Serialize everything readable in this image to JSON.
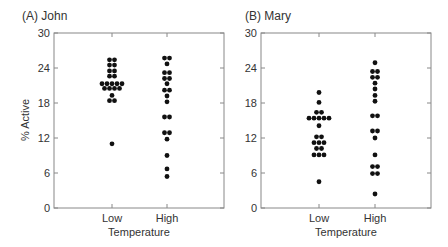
{
  "chart_data": [
    {
      "type": "scatter",
      "subtype": "dot-plot",
      "title": "(A)  John",
      "xlabel": "Temperature",
      "ylabel": "% Active",
      "ylim": [
        0,
        30
      ],
      "yticks": [
        0,
        6,
        12,
        18,
        24,
        30
      ],
      "categories": [
        "Low",
        "High"
      ],
      "grid": false,
      "series": [
        {
          "name": "Low",
          "rows": [
            {
              "value": 25.4,
              "count": 2
            },
            {
              "value": 24.5,
              "count": 2
            },
            {
              "value": 23.5,
              "count": 2
            },
            {
              "value": 22.6,
              "count": 2
            },
            {
              "value": 21.3,
              "count": 5
            },
            {
              "value": 20.5,
              "count": 4
            },
            {
              "value": 19.3,
              "count": 1
            },
            {
              "value": 18.4,
              "count": 2
            },
            {
              "value": 11.0,
              "count": 1
            }
          ]
        },
        {
          "name": "High",
          "rows": [
            {
              "value": 25.7,
              "count": 2
            },
            {
              "value": 24.7,
              "count": 1
            },
            {
              "value": 23.2,
              "count": 2
            },
            {
              "value": 22.2,
              "count": 2
            },
            {
              "value": 21.3,
              "count": 1
            },
            {
              "value": 20.2,
              "count": 2
            },
            {
              "value": 19.2,
              "count": 1
            },
            {
              "value": 18.2,
              "count": 1
            },
            {
              "value": 15.6,
              "count": 2
            },
            {
              "value": 12.9,
              "count": 2
            },
            {
              "value": 11.8,
              "count": 1
            },
            {
              "value": 9.0,
              "count": 1
            },
            {
              "value": 6.7,
              "count": 1
            },
            {
              "value": 5.4,
              "count": 1
            }
          ]
        }
      ]
    },
    {
      "type": "scatter",
      "subtype": "dot-plot",
      "title": "(B)  Mary",
      "xlabel": "Temperature",
      "ylabel": "",
      "ylim": [
        0,
        30
      ],
      "yticks": [
        0,
        6,
        12,
        18,
        24,
        30
      ],
      "categories": [
        "Low",
        "High"
      ],
      "grid": false,
      "series": [
        {
          "name": "Low",
          "rows": [
            {
              "value": 19.8,
              "count": 1
            },
            {
              "value": 18.1,
              "count": 1
            },
            {
              "value": 16.4,
              "count": 2
            },
            {
              "value": 15.4,
              "count": 5
            },
            {
              "value": 14.1,
              "count": 1
            },
            {
              "value": 12.2,
              "count": 2
            },
            {
              "value": 11.2,
              "count": 3
            },
            {
              "value": 10.2,
              "count": 2
            },
            {
              "value": 9.1,
              "count": 3
            },
            {
              "value": 4.5,
              "count": 1
            }
          ]
        },
        {
          "name": "High",
          "rows": [
            {
              "value": 24.9,
              "count": 1
            },
            {
              "value": 23.4,
              "count": 2
            },
            {
              "value": 22.4,
              "count": 2
            },
            {
              "value": 21.4,
              "count": 1
            },
            {
              "value": 20.4,
              "count": 1
            },
            {
              "value": 19.3,
              "count": 1
            },
            {
              "value": 18.3,
              "count": 1
            },
            {
              "value": 15.8,
              "count": 2
            },
            {
              "value": 13.2,
              "count": 2
            },
            {
              "value": 12.0,
              "count": 1
            },
            {
              "value": 9.1,
              "count": 1
            },
            {
              "value": 7.1,
              "count": 2
            },
            {
              "value": 5.9,
              "count": 2
            },
            {
              "value": 2.4,
              "count": 1
            }
          ]
        }
      ]
    }
  ],
  "colors": {
    "dot": "#111111",
    "axis": "#888888",
    "text": "#333333"
  }
}
